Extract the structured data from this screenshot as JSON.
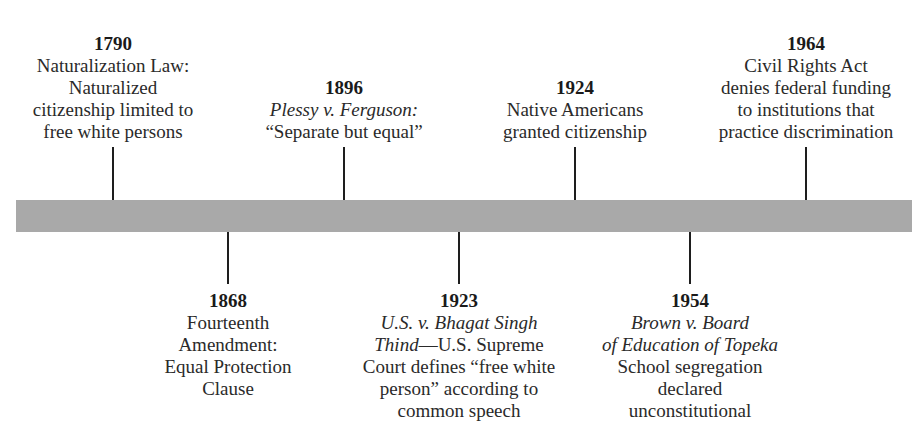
{
  "timeline": {
    "bar_color": "#a9a9a9",
    "events": [
      {
        "year": "1790",
        "position": "above",
        "x": 113,
        "lines": [
          "Naturalization Law:",
          "Naturalized",
          "citizenship limited to",
          "free white persons"
        ]
      },
      {
        "year": "1868",
        "position": "below",
        "x": 228,
        "lines": [
          "Fourteenth",
          "Amendment:",
          "Equal Protection",
          "Clause"
        ]
      },
      {
        "year": "1896",
        "position": "above",
        "x": 344,
        "case": "Plessy v. Ferguson:",
        "lines": [
          "“Separate but equal”"
        ]
      },
      {
        "year": "1923",
        "position": "below",
        "x": 459,
        "case": "U.S. v. Bhagat Singh",
        "case2": "Thind",
        "case2_rest": "—U.S. Supreme",
        "lines": [
          "Court defines “free white",
          "person” according to",
          "common speech"
        ]
      },
      {
        "year": "1924",
        "position": "above",
        "x": 575,
        "lines": [
          "Native Americans",
          "granted citizenship"
        ]
      },
      {
        "year": "1954",
        "position": "below",
        "x": 690,
        "case": "Brown v. Board",
        "case2": "of Education of Topeka",
        "lines": [
          "School segregation",
          "declared",
          "unconstitutional"
        ]
      },
      {
        "year": "1964",
        "position": "above",
        "x": 806,
        "lines": [
          "Civil Rights Act",
          "denies federal funding",
          "to institutions that",
          "practice discrimination"
        ]
      }
    ]
  }
}
